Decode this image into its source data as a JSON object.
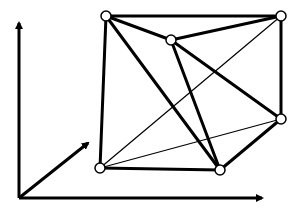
{
  "diagram": {
    "type": "graph-in-3d-axes",
    "colors": {
      "stroke": "#000000",
      "node_fill": "#ffffff",
      "background": "#ffffff"
    },
    "nodes": [
      {
        "id": "A",
        "label": ""
      },
      {
        "id": "B",
        "label": ""
      },
      {
        "id": "C",
        "label": ""
      },
      {
        "id": "D",
        "label": ""
      },
      {
        "id": "E",
        "label": ""
      },
      {
        "id": "F",
        "label": ""
      }
    ],
    "edges": [
      {
        "from": "A",
        "to": "B",
        "weight": "thick"
      },
      {
        "from": "A",
        "to": "C",
        "weight": "thick"
      },
      {
        "from": "A",
        "to": "E",
        "weight": "thick"
      },
      {
        "from": "A",
        "to": "F",
        "weight": "thick"
      },
      {
        "from": "B",
        "to": "C",
        "weight": "thick"
      },
      {
        "from": "B",
        "to": "D",
        "weight": "thick"
      },
      {
        "from": "C",
        "to": "E",
        "weight": "thick"
      },
      {
        "from": "C",
        "to": "D",
        "weight": "thick"
      },
      {
        "from": "F",
        "to": "E",
        "weight": "thick"
      },
      {
        "from": "E",
        "to": "D",
        "weight": "thick"
      },
      {
        "from": "F",
        "to": "B",
        "weight": "thin"
      },
      {
        "from": "F",
        "to": "D",
        "weight": "thin"
      }
    ],
    "axes": [
      {
        "id": "vertical-axis",
        "label": ""
      },
      {
        "id": "horizontal-axis",
        "label": ""
      },
      {
        "id": "depth-axis",
        "label": ""
      }
    ]
  }
}
